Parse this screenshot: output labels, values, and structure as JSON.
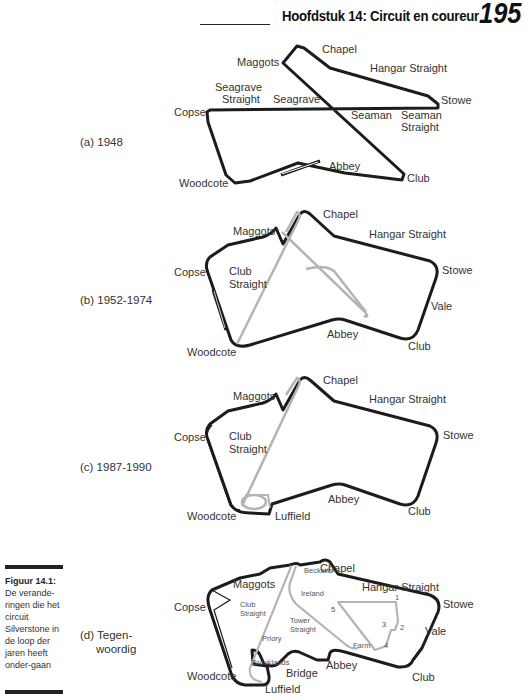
{
  "header": {
    "chapter_title": "Hoofdstuk 14: Circuit en coureur",
    "page_number": "195"
  },
  "figure": {
    "caption_title": "Figuur 14.1:",
    "caption_text": "De verande-ringen die het circuit Silverstone in de loop der jaren heeft onder-gaan",
    "panels": [
      {
        "label": "(a) 1948",
        "corners": [
          "Maggots",
          "Chapel",
          "Hangar Straight",
          "Seagrave",
          "Straight",
          "Seagrave",
          "Stowe",
          "Copse",
          "Seaman",
          "Seaman",
          "Straight",
          "Abbey",
          "Club",
          "Woodcote"
        ]
      },
      {
        "label": "(b) 1952-1974",
        "corners": [
          "Chapel",
          "Maggots",
          "Hangar Straight",
          "Stowe",
          "Copse",
          "Club",
          "Straight",
          "Vale",
          "Abbey",
          "Club",
          "Woodcote"
        ]
      },
      {
        "label": "(c) 1987-1990",
        "corners": [
          "Chapel",
          "Maggots",
          "Hangar Straight",
          "Stowe",
          "Copse",
          "Club",
          "Straight",
          "Abbey",
          "Club",
          "Woodcote",
          "Luffield"
        ]
      },
      {
        "label_line1": "(d) Tegen-",
        "label_line2": "woordig",
        "corners": [
          "Chapel",
          "Maggots",
          "Hangar Straight",
          "Becketts",
          "Ireland",
          "Stowe",
          "Copse",
          "Club",
          "Straight",
          "Tower",
          "Straight",
          "Vale",
          "Priory",
          "Farm",
          "Brooklands",
          "Abbey",
          "Club",
          "Woodcote",
          "Bridge",
          "Luffield"
        ],
        "numbers": [
          "1",
          "2",
          "3",
          "4",
          "5"
        ]
      }
    ]
  },
  "colors": {
    "track": "#1c1c1c",
    "old_track": "#b4b4b4"
  }
}
